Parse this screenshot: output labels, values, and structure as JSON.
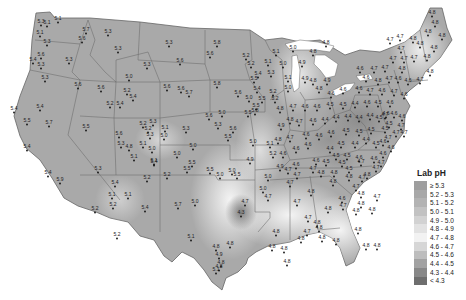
{
  "map": {
    "title": "Lab pH",
    "colors": {
      "land_base": "#a9a9a9",
      "land_light": "#d8d8d8",
      "land_lighter": "#ececec",
      "land_dark": "#8a8a8a",
      "border": "#666666",
      "background": "#ffffff"
    }
  },
  "legend": {
    "title": "Lab pH",
    "items": [
      {
        "label": "≥ 5.3",
        "color": "#9e9e9e"
      },
      {
        "label": "5.2 - 5.3",
        "color": "#a8a8a8"
      },
      {
        "label": "5.1 - 5.2",
        "color": "#b3b3b3"
      },
      {
        "label": "5.0 - 5.1",
        "color": "#c2c2c2"
      },
      {
        "label": "4.9 - 5.0",
        "color": "#d2d2d2"
      },
      {
        "label": "4.8 - 4.9",
        "color": "#e2e2e2"
      },
      {
        "label": "4.7 - 4.8",
        "color": "#f2f2f2"
      },
      {
        "label": "4.6 - 4.7",
        "color": "#d6d6d6"
      },
      {
        "label": "4.5 - 4.6",
        "color": "#bdbdbd"
      },
      {
        "label": "4.4 - 4.5",
        "color": "#a2a2a2"
      },
      {
        "label": "4.3 - 4.4",
        "color": "#888888"
      },
      {
        "label": "< 4.3",
        "color": "#6e6e6e"
      }
    ]
  },
  "stations": [
    {
      "x": 58,
      "y": 20,
      "v": "5.1"
    },
    {
      "x": 41,
      "y": 23,
      "v": "5.3"
    },
    {
      "x": 47,
      "y": 24,
      "v": "5.1"
    },
    {
      "x": 40,
      "y": 34,
      "v": "5.1"
    },
    {
      "x": 47,
      "y": 43,
      "v": "5.3"
    },
    {
      "x": 86,
      "y": 31,
      "v": "5.7"
    },
    {
      "x": 82,
      "y": 40,
      "v": "5.6"
    },
    {
      "x": 41,
      "y": 56,
      "v": "5.6"
    },
    {
      "x": 33,
      "y": 61,
      "v": "5.4"
    },
    {
      "x": 41,
      "y": 66,
      "v": "5.3"
    },
    {
      "x": 69,
      "y": 61,
      "v": "5.3"
    },
    {
      "x": 45,
      "y": 79,
      "v": "5.3"
    },
    {
      "x": 108,
      "y": 33,
      "v": "5.3"
    },
    {
      "x": 118,
      "y": 50,
      "v": "5.3"
    },
    {
      "x": 147,
      "y": 66,
      "v": "5.3"
    },
    {
      "x": 129,
      "y": 78,
      "v": "5.0"
    },
    {
      "x": 78,
      "y": 86,
      "v": "5.6"
    },
    {
      "x": 101,
      "y": 89,
      "v": "5.6"
    },
    {
      "x": 127,
      "y": 92,
      "v": "5.2"
    },
    {
      "x": 133,
      "y": 98,
      "v": "5.4"
    },
    {
      "x": 110,
      "y": 105,
      "v": "5.2"
    },
    {
      "x": 120,
      "y": 105,
      "v": "5.4"
    },
    {
      "x": 169,
      "y": 44,
      "v": "5.3"
    },
    {
      "x": 217,
      "y": 44,
      "v": "5.8"
    },
    {
      "x": 210,
      "y": 55,
      "v": "5.6"
    },
    {
      "x": 180,
      "y": 62,
      "v": "5.6"
    },
    {
      "x": 167,
      "y": 88,
      "v": "5.6"
    },
    {
      "x": 181,
      "y": 90,
      "v": "5.6"
    },
    {
      "x": 189,
      "y": 94,
      "v": "5.7"
    },
    {
      "x": 217,
      "y": 85,
      "v": "5.8"
    },
    {
      "x": 238,
      "y": 94,
      "v": "5.6"
    },
    {
      "x": 248,
      "y": 114,
      "v": "5.5"
    },
    {
      "x": 209,
      "y": 117,
      "v": "5.6"
    },
    {
      "x": 14,
      "y": 110,
      "v": "5.4"
    },
    {
      "x": 40,
      "y": 108,
      "v": "5.4"
    },
    {
      "x": 27,
      "y": 122,
      "v": "5.5"
    },
    {
      "x": 49,
      "y": 124,
      "v": "5.7"
    },
    {
      "x": 86,
      "y": 128,
      "v": "5.5"
    },
    {
      "x": 27,
      "y": 148,
      "v": "5.4"
    },
    {
      "x": 48,
      "y": 174,
      "v": "5.4"
    },
    {
      "x": 60,
      "y": 181,
      "v": "5.9"
    },
    {
      "x": 119,
      "y": 135,
      "v": "5.6"
    },
    {
      "x": 121,
      "y": 145,
      "v": "5.3"
    },
    {
      "x": 129,
      "y": 148,
      "v": "4.8"
    },
    {
      "x": 143,
      "y": 125,
      "v": "5.2"
    },
    {
      "x": 153,
      "y": 123,
      "v": "5.3"
    },
    {
      "x": 148,
      "y": 130,
      "v": "5.2"
    },
    {
      "x": 150,
      "y": 136,
      "v": "5.3"
    },
    {
      "x": 143,
      "y": 145,
      "v": "5.1"
    },
    {
      "x": 152,
      "y": 150,
      "v": "5.0"
    },
    {
      "x": 165,
      "y": 129,
      "v": "5.1"
    },
    {
      "x": 164,
      "y": 137,
      "v": "5.0"
    },
    {
      "x": 134,
      "y": 158,
      "v": "5.1"
    },
    {
      "x": 154,
      "y": 162,
      "v": "5.1"
    },
    {
      "x": 98,
      "y": 170,
      "v": "5.3"
    },
    {
      "x": 115,
      "y": 184,
      "v": "5.4"
    },
    {
      "x": 112,
      "y": 196,
      "v": "5.1"
    },
    {
      "x": 113,
      "y": 206,
      "v": "5.2"
    },
    {
      "x": 128,
      "y": 196,
      "v": "5.1"
    },
    {
      "x": 95,
      "y": 210,
      "v": "5.2"
    },
    {
      "x": 145,
      "y": 209,
      "v": "5.4"
    },
    {
      "x": 167,
      "y": 176,
      "v": "5.2"
    },
    {
      "x": 147,
      "y": 179,
      "v": "5.2"
    },
    {
      "x": 177,
      "y": 155,
      "v": "5.0"
    },
    {
      "x": 193,
      "y": 147,
      "v": "5.0"
    },
    {
      "x": 154,
      "y": 163,
      "v": "5.4"
    },
    {
      "x": 117,
      "y": 236,
      "v": "5.2"
    },
    {
      "x": 178,
      "y": 206,
      "v": "5.7"
    },
    {
      "x": 233,
      "y": 130,
      "v": "5.6"
    },
    {
      "x": 228,
      "y": 138,
      "v": "5.5"
    },
    {
      "x": 255,
      "y": 112,
      "v": "5.8"
    },
    {
      "x": 257,
      "y": 90,
      "v": "5.4"
    },
    {
      "x": 256,
      "y": 107,
      "v": "5.5"
    },
    {
      "x": 262,
      "y": 100,
      "v": "5.5"
    },
    {
      "x": 249,
      "y": 99,
      "v": "5.0"
    },
    {
      "x": 222,
      "y": 114,
      "v": "5.0"
    },
    {
      "x": 218,
      "y": 126,
      "v": "5.3"
    },
    {
      "x": 186,
      "y": 130,
      "v": "5.3"
    },
    {
      "x": 253,
      "y": 143,
      "v": "5.0"
    },
    {
      "x": 270,
      "y": 145,
      "v": "5.1"
    },
    {
      "x": 273,
      "y": 155,
      "v": "5.2"
    },
    {
      "x": 250,
      "y": 161,
      "v": "4.9"
    },
    {
      "x": 232,
      "y": 172,
      "v": "5.0"
    },
    {
      "x": 192,
      "y": 164,
      "v": "5.5"
    },
    {
      "x": 187,
      "y": 170,
      "v": "5.5"
    },
    {
      "x": 220,
      "y": 176,
      "v": "5.0"
    },
    {
      "x": 237,
      "y": 176,
      "v": "5.5"
    },
    {
      "x": 210,
      "y": 171,
      "v": "5.5"
    },
    {
      "x": 245,
      "y": 203,
      "v": "4.7"
    },
    {
      "x": 263,
      "y": 190,
      "v": "5.0"
    },
    {
      "x": 268,
      "y": 198,
      "v": "4.7"
    },
    {
      "x": 195,
      "y": 203,
      "v": "5.0"
    },
    {
      "x": 191,
      "y": 238,
      "v": "5.1"
    },
    {
      "x": 216,
      "y": 248,
      "v": "4.8"
    },
    {
      "x": 219,
      "y": 256,
      "v": "4.9"
    },
    {
      "x": 241,
      "y": 214,
      "v": "4.3"
    },
    {
      "x": 230,
      "y": 245,
      "v": "4.8"
    },
    {
      "x": 221,
      "y": 264,
      "v": "4.8"
    },
    {
      "x": 216,
      "y": 271,
      "v": "5.1"
    },
    {
      "x": 219,
      "y": 268,
      "v": "4.8"
    },
    {
      "x": 276,
      "y": 233,
      "v": "4.8"
    },
    {
      "x": 272,
      "y": 248,
      "v": "4.8"
    },
    {
      "x": 284,
      "y": 250,
      "v": "4.8"
    },
    {
      "x": 287,
      "y": 263,
      "v": "4.8"
    },
    {
      "x": 301,
      "y": 240,
      "v": "4.8"
    },
    {
      "x": 308,
      "y": 219,
      "v": "4.7"
    },
    {
      "x": 317,
      "y": 224,
      "v": "4.8"
    },
    {
      "x": 319,
      "y": 229,
      "v": "4.8"
    },
    {
      "x": 307,
      "y": 233,
      "v": "4.7"
    },
    {
      "x": 322,
      "y": 239,
      "v": "4.8"
    },
    {
      "x": 336,
      "y": 242,
      "v": "4.8"
    },
    {
      "x": 297,
      "y": 203,
      "v": "4.7"
    },
    {
      "x": 290,
      "y": 184,
      "v": "4.7"
    },
    {
      "x": 311,
      "y": 193,
      "v": "4.8"
    },
    {
      "x": 328,
      "y": 210,
      "v": "4.8"
    },
    {
      "x": 343,
      "y": 207,
      "v": "4.7"
    },
    {
      "x": 356,
      "y": 212,
      "v": "4.8"
    },
    {
      "x": 358,
      "y": 231,
      "v": "4.8"
    },
    {
      "x": 366,
      "y": 247,
      "v": "4.8"
    },
    {
      "x": 377,
      "y": 247,
      "v": "4.8"
    },
    {
      "x": 356,
      "y": 188,
      "v": "4.7"
    },
    {
      "x": 362,
      "y": 179,
      "v": "4.7"
    },
    {
      "x": 334,
      "y": 174,
      "v": "4.8"
    },
    {
      "x": 333,
      "y": 183,
      "v": "4.8"
    },
    {
      "x": 321,
      "y": 174,
      "v": "4.8"
    },
    {
      "x": 342,
      "y": 200,
      "v": "4.6"
    },
    {
      "x": 361,
      "y": 195,
      "v": "4.8"
    },
    {
      "x": 377,
      "y": 198,
      "v": "4.7"
    },
    {
      "x": 372,
      "y": 211,
      "v": "4.8"
    },
    {
      "x": 367,
      "y": 176,
      "v": "4.8"
    },
    {
      "x": 376,
      "y": 169,
      "v": "4.7"
    },
    {
      "x": 361,
      "y": 205,
      "v": "4.8"
    },
    {
      "x": 342,
      "y": 164,
      "v": "4.5"
    },
    {
      "x": 336,
      "y": 157,
      "v": "4.5"
    },
    {
      "x": 347,
      "y": 157,
      "v": "4.5"
    },
    {
      "x": 349,
      "y": 170,
      "v": "4.5"
    },
    {
      "x": 361,
      "y": 163,
      "v": "4.7"
    },
    {
      "x": 374,
      "y": 160,
      "v": "4.6"
    },
    {
      "x": 381,
      "y": 164,
      "v": "4.7"
    },
    {
      "x": 359,
      "y": 159,
      "v": "4.6"
    },
    {
      "x": 383,
      "y": 155,
      "v": "4.6"
    },
    {
      "x": 288,
      "y": 171,
      "v": "4.7"
    },
    {
      "x": 296,
      "y": 166,
      "v": "4.6"
    },
    {
      "x": 313,
      "y": 170,
      "v": "4.7"
    },
    {
      "x": 297,
      "y": 176,
      "v": "4.7"
    },
    {
      "x": 280,
      "y": 168,
      "v": "4.9"
    },
    {
      "x": 268,
      "y": 178,
      "v": "5.0"
    },
    {
      "x": 283,
      "y": 155,
      "v": "4.6"
    },
    {
      "x": 296,
      "y": 150,
      "v": "4.6"
    },
    {
      "x": 308,
      "y": 146,
      "v": "4.6"
    },
    {
      "x": 316,
      "y": 162,
      "v": "4.6"
    },
    {
      "x": 326,
      "y": 163,
      "v": "4.5"
    },
    {
      "x": 330,
      "y": 150,
      "v": "4.4"
    },
    {
      "x": 341,
      "y": 145,
      "v": "4.5"
    },
    {
      "x": 355,
      "y": 145,
      "v": "4.4"
    },
    {
      "x": 366,
      "y": 141,
      "v": "4.4"
    },
    {
      "x": 376,
      "y": 145,
      "v": "4.5"
    },
    {
      "x": 383,
      "y": 143,
      "v": "4.6"
    },
    {
      "x": 388,
      "y": 139,
      "v": "4.7"
    },
    {
      "x": 396,
      "y": 134,
      "v": "4.7"
    },
    {
      "x": 391,
      "y": 149,
      "v": "4.6"
    },
    {
      "x": 385,
      "y": 130,
      "v": "4.5"
    },
    {
      "x": 371,
      "y": 131,
      "v": "4.5"
    },
    {
      "x": 359,
      "y": 133,
      "v": "4.5"
    },
    {
      "x": 346,
      "y": 132,
      "v": "4.5"
    },
    {
      "x": 331,
      "y": 134,
      "v": "4.6"
    },
    {
      "x": 319,
      "y": 137,
      "v": "4.6"
    },
    {
      "x": 306,
      "y": 136,
      "v": "4.6"
    },
    {
      "x": 290,
      "y": 139,
      "v": "4.7"
    },
    {
      "x": 278,
      "y": 141,
      "v": "4.8"
    },
    {
      "x": 299,
      "y": 123,
      "v": "4.7"
    },
    {
      "x": 313,
      "y": 122,
      "v": "4.6"
    },
    {
      "x": 325,
      "y": 121,
      "v": "4.4"
    },
    {
      "x": 336,
      "y": 119,
      "v": "4.4"
    },
    {
      "x": 348,
      "y": 118,
      "v": "4.4"
    },
    {
      "x": 359,
      "y": 119,
      "v": "4.4"
    },
    {
      "x": 370,
      "y": 117,
      "v": "4.4"
    },
    {
      "x": 379,
      "y": 119,
      "v": "4.5"
    },
    {
      "x": 386,
      "y": 115,
      "v": "4.6"
    },
    {
      "x": 394,
      "y": 115,
      "v": "4.6"
    },
    {
      "x": 402,
      "y": 118,
      "v": "4.6"
    },
    {
      "x": 389,
      "y": 125,
      "v": "4.5"
    },
    {
      "x": 401,
      "y": 127,
      "v": "4.7"
    },
    {
      "x": 404,
      "y": 134,
      "v": "4.7"
    },
    {
      "x": 390,
      "y": 104,
      "v": "4.6"
    },
    {
      "x": 378,
      "y": 104,
      "v": "4.5"
    },
    {
      "x": 367,
      "y": 104,
      "v": "4.6"
    },
    {
      "x": 355,
      "y": 105,
      "v": "4.4"
    },
    {
      "x": 343,
      "y": 106,
      "v": "4.5"
    },
    {
      "x": 330,
      "y": 106,
      "v": "4.5"
    },
    {
      "x": 317,
      "y": 108,
      "v": "4.6"
    },
    {
      "x": 305,
      "y": 108,
      "v": "4.6"
    },
    {
      "x": 293,
      "y": 108,
      "v": "4.7"
    },
    {
      "x": 280,
      "y": 110,
      "v": "4.8"
    },
    {
      "x": 290,
      "y": 121,
      "v": "4.8"
    },
    {
      "x": 281,
      "y": 127,
      "v": "4.9"
    },
    {
      "x": 359,
      "y": 90,
      "v": "4.6"
    },
    {
      "x": 370,
      "y": 92,
      "v": "4.7"
    },
    {
      "x": 382,
      "y": 92,
      "v": "4.6"
    },
    {
      "x": 394,
      "y": 93,
      "v": "4.7"
    },
    {
      "x": 404,
      "y": 96,
      "v": "4.6"
    },
    {
      "x": 343,
      "y": 91,
      "v": "4.6"
    },
    {
      "x": 331,
      "y": 95,
      "v": "4.6"
    },
    {
      "x": 378,
      "y": 82,
      "v": "4.8"
    },
    {
      "x": 389,
      "y": 80,
      "v": "4.7"
    },
    {
      "x": 398,
      "y": 80,
      "v": "4.6"
    },
    {
      "x": 408,
      "y": 82,
      "v": "4.6"
    },
    {
      "x": 420,
      "y": 81,
      "v": "4.7"
    },
    {
      "x": 366,
      "y": 79,
      "v": "4.6"
    },
    {
      "x": 360,
      "y": 70,
      "v": "4.6"
    },
    {
      "x": 374,
      "y": 70,
      "v": "4.7"
    },
    {
      "x": 385,
      "y": 69,
      "v": "4.7"
    },
    {
      "x": 402,
      "y": 70,
      "v": "4.8"
    },
    {
      "x": 430,
      "y": 73,
      "v": "4.8"
    },
    {
      "x": 393,
      "y": 60,
      "v": "4.7"
    },
    {
      "x": 404,
      "y": 60,
      "v": "4.7"
    },
    {
      "x": 414,
      "y": 59,
      "v": "4.7"
    },
    {
      "x": 427,
      "y": 58,
      "v": "4.8"
    },
    {
      "x": 420,
      "y": 45,
      "v": "4.8"
    },
    {
      "x": 434,
      "y": 49,
      "v": "4.8"
    },
    {
      "x": 442,
      "y": 37,
      "v": "4.8"
    },
    {
      "x": 428,
      "y": 33,
      "v": "4.8"
    },
    {
      "x": 432,
      "y": 14,
      "v": "4.8"
    },
    {
      "x": 435,
      "y": 24,
      "v": "4.8"
    },
    {
      "x": 401,
      "y": 50,
      "v": "4.7"
    },
    {
      "x": 390,
      "y": 41,
      "v": "4.7"
    },
    {
      "x": 400,
      "y": 38,
      "v": "4.7"
    },
    {
      "x": 413,
      "y": 40,
      "v": "4.8"
    },
    {
      "x": 385,
      "y": 116,
      "v": "4.7"
    },
    {
      "x": 349,
      "y": 178,
      "v": "4.8"
    },
    {
      "x": 326,
      "y": 44,
      "v": "4.8"
    },
    {
      "x": 313,
      "y": 53,
      "v": "4.8"
    },
    {
      "x": 302,
      "y": 64,
      "v": "4.9"
    },
    {
      "x": 305,
      "y": 80,
      "v": "4.9"
    },
    {
      "x": 313,
      "y": 82,
      "v": "4.8"
    },
    {
      "x": 319,
      "y": 90,
      "v": "4.8"
    },
    {
      "x": 327,
      "y": 82,
      "v": "4.9"
    },
    {
      "x": 293,
      "y": 49,
      "v": "5.0"
    },
    {
      "x": 276,
      "y": 53,
      "v": "5.1"
    },
    {
      "x": 268,
      "y": 63,
      "v": "5.1"
    },
    {
      "x": 283,
      "y": 65,
      "v": "5.0"
    },
    {
      "x": 271,
      "y": 74,
      "v": "5.3"
    },
    {
      "x": 288,
      "y": 79,
      "v": "5.1"
    },
    {
      "x": 288,
      "y": 89,
      "v": "5.0"
    },
    {
      "x": 273,
      "y": 93,
      "v": "5.2"
    },
    {
      "x": 275,
      "y": 100,
      "v": "5.2"
    },
    {
      "x": 246,
      "y": 57,
      "v": "5.2"
    },
    {
      "x": 251,
      "y": 65,
      "v": "5.2"
    },
    {
      "x": 258,
      "y": 75,
      "v": "5.4"
    },
    {
      "x": 254,
      "y": 80,
      "v": "5.5"
    }
  ]
}
